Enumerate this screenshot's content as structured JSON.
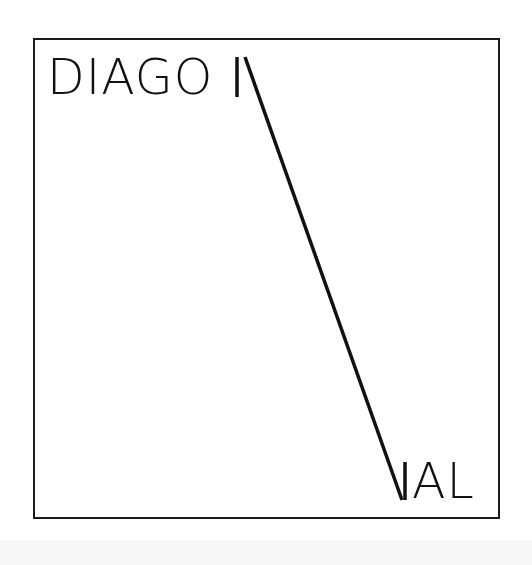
{
  "artwork": {
    "text_start": "DIAGO",
    "text_end": "AL",
    "full_word": "DIAGONAL",
    "stroke_color": "#111111",
    "background_color": "#ffffff"
  }
}
